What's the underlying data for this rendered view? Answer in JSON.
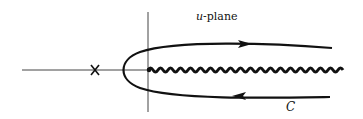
{
  "diagram": {
    "title_var": "u",
    "title_rest": "-plane",
    "contour_label": "C",
    "colors": {
      "ink": "#111111",
      "axis": "#333333",
      "background": "#ffffff"
    },
    "elements": {
      "real_axis": {
        "x1": 22,
        "x2": 148,
        "y": 70
      },
      "imag_axis": {
        "x": 148,
        "y1": 12,
        "y2": 112
      },
      "singularity_marker": {
        "symbol": "X",
        "x": 95,
        "y": 70
      },
      "branch_cut": {
        "style": "wavy",
        "x_start": 148,
        "x_end": 343,
        "y": 70
      },
      "contour": {
        "shape": "hairpin",
        "vertex": {
          "x": 121,
          "y": 70
        },
        "upper_end": {
          "x": 332,
          "y": 48
        },
        "lower_end": {
          "x": 330,
          "y": 97
        },
        "upper_arrow_direction": "right",
        "lower_arrow_direction": "left"
      }
    }
  }
}
